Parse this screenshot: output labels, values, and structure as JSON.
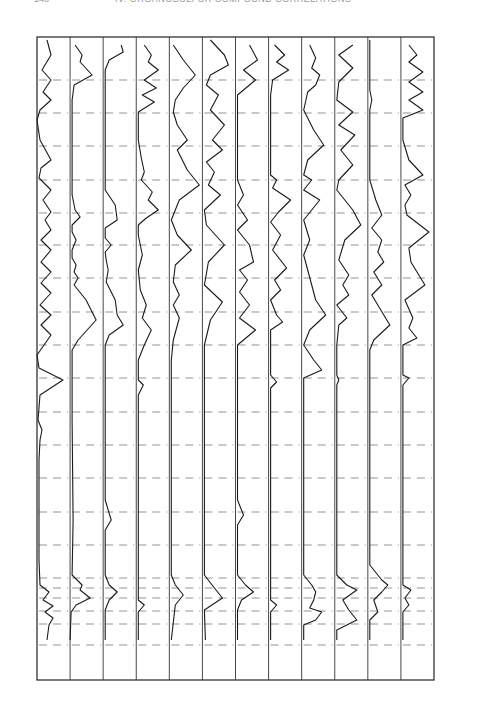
{
  "header": {
    "page_number": "148",
    "title": "IV. ORGANOSULFUR COMPOUND CORRELATIONS"
  },
  "chart_data": {
    "type": "line",
    "orientation": "rotated 90° (wavenumber runs bottom-to-top)",
    "xlabel": "CM-1",
    "x_secondary_label": "µm",
    "x_ticks_wavenumber": [
      "600",
      "700",
      "800",
      "900",
      "1000",
      "1100",
      "1200",
      "1300",
      "1400",
      "1500",
      "1600",
      "1700",
      "1800",
      "1900",
      "2000",
      "2400",
      "2800",
      "3200",
      "3600",
      "4000"
    ],
    "x_ticks_wavelength": [
      "14",
      "12",
      "10",
      "9",
      "8",
      "7",
      "6",
      "5",
      "4",
      "3",
      "2.5 µm"
    ],
    "series": [
      {
        "id": "541",
        "formula": "CH3-CH2-CH2-S-CH=CH2",
        "condition": ".015",
        "labels": [
          "=CH2",
          "2x880",
          "C=C STR",
          "=CH2 WAG",
          "C=C-H"
        ]
      },
      {
        "id": "542",
        "formula": "CH3-S(=O)-CH3",
        "condition": ".015, CAP",
        "labels": [
          "SCH3 STR",
          "SCH3 ASYM DEF",
          "SCH3 SYM DEF",
          "SCH3 RK",
          "SO STR",
          "C-S STR"
        ]
      },
      {
        "id": "543",
        "formula": "N≡C-CH2-CH2-S(=O)-CH2-CH2-C≡N",
        "condition": "N",
        "labels": [
          "N",
          "C≡N",
          "N",
          "CH2 DEF",
          "SO STR"
        ]
      },
      {
        "id": "544",
        "formula": "Ph-S(=O)-Ph",
        "condition": "N",
        "labels": [
          "φ",
          "φ",
          "φ",
          "φ-S",
          "SO",
          "φ",
          "φ",
          "φ"
        ]
      },
      {
        "id": "545",
        "formula": "C2H5-O-S(=O)-O-C2H5",
        "condition": ".015",
        "labels": [
          "OCH2 DEF",
          "CH3",
          "OCH2 WAG",
          "S=O",
          "SOC",
          "OSO"
        ]
      },
      {
        "id": "546",
        "formula": "n-C4H9-O-S(=O)-O-n-C4H9",
        "condition": ".02, CAP",
        "labels": [
          "CH2",
          "CH3",
          "S=O",
          "SOC",
          "OSO"
        ]
      },
      {
        "id": "547",
        "formula": "N≡C-CH2-CH2-S(=O)(=O)-CH2-CH2-C≡N",
        "condition": "N",
        "labels": [
          "C≡N",
          "N",
          "N",
          "CH2",
          "SO2 ASYM",
          "SO2 SYM"
        ]
      },
      {
        "id": "548",
        "formula": "Ph-S(=O)(=O)-Ph",
        "condition": "N, HCBD",
        "labels": [
          "φ",
          "φ",
          "φ",
          "SO2 ASYM",
          "SO2 SYM",
          "φ-S",
          "φ",
          "φ"
        ]
      },
      {
        "id": "549",
        "formula": "Ph-S(=O)(=O)-NH2",
        "condition": "N",
        "labels": [
          "NH2 STR",
          "N",
          "NH2 DEF",
          "N",
          "SO2",
          "SO2",
          "φ-S",
          "S-N",
          "φ",
          "NH2 WAG"
        ]
      },
      {
        "id": "550",
        "formula": "CH2=CH-S(=O)(=O)-NH-CH(CH3)-CH3",
        "condition": ".015",
        "labels": [
          "NH",
          "CH3",
          "2x970",
          "C=C",
          "SO2",
          "SO2",
          "H-C=C-H =CH2"
        ]
      },
      {
        "id": "551",
        "formula": "Br-CH2-CH2-S(=O)(=O)-NH-CH(CH3)-CH3",
        "condition": "N",
        "labels": [
          "NH",
          "N",
          "N",
          "SO2",
          "SO2",
          "SO2"
        ]
      },
      {
        "id": "552",
        "formula": "Ph-S(=O)(=O)-O-CH3",
        "condition": ".015",
        "labels": [
          "CH3",
          "φ",
          "φ",
          "CH3",
          "SO2",
          "SO2",
          "S-φ",
          "S-O-C",
          "SOC",
          "φ"
        ]
      }
    ]
  },
  "strips": [
    {
      "id": "541",
      "cond": ".015",
      "f": "CH₃-CH₂-CH₂-S-CH=CH₂",
      "f2": ""
    },
    {
      "id": "542",
      "cond": ".015, CAP",
      "f": "CH₃-S-CH₃",
      "f2": "O"
    },
    {
      "id": "543",
      "cond": "N",
      "f": "N≡C-CH₂-CH₂-S-CH₂-CH₂-C≡N",
      "f2": "O"
    },
    {
      "id": "544",
      "cond": "N",
      "f": "⌬-S-⌬",
      "f2": "O"
    },
    {
      "id": "545",
      "cond": ".015",
      "f": "C₂H₅-O-S-O-C₂H₅",
      "f2": "O"
    },
    {
      "id": "546",
      "cond": ".02 , CAP",
      "f": "n-C₄H₉-O-S-O-n-C₄H₉",
      "f2": "O"
    },
    {
      "id": "547",
      "cond": "N",
      "f": "N≡C-CH₂-CH₂-S-CH₂-CH₂-C≡N",
      "f2": "O   O"
    },
    {
      "id": "548",
      "cond": "N, HCBD",
      "f": "O=S=O  ⌬ ⌬",
      "f2": ""
    },
    {
      "id": "549",
      "cond": "N",
      "f": "⌬-O=S=O-NH₂",
      "f2": ""
    },
    {
      "id": "550",
      "cond": ".015",
      "f": "CH₂=CH-S-NH-CH(CH₃)CH₃",
      "f2": "O   O"
    },
    {
      "id": "551",
      "cond": "N",
      "f": "Br-CH₂-CH₂-S-NH-CH(CH₃)CH₃",
      "f2": "O   O"
    },
    {
      "id": "552",
      "cond": ".015",
      "f": "⌬-S-O-CH₃",
      "f2": "O   O"
    }
  ],
  "axis": {
    "right_unit": "CM⁻¹",
    "right_ticks": [
      {
        "t": "600",
        "y": 47
      },
      {
        "t": "700",
        "y": 80
      },
      {
        "t": "800",
        "y": 113
      },
      {
        "t": "900",
        "y": 146
      },
      {
        "t": "1000",
        "y": 180
      },
      {
        "t": "1100",
        "y": 213
      },
      {
        "t": "1200",
        "y": 245
      },
      {
        "t": "1300",
        "y": 278
      },
      {
        "t": "1400",
        "y": 312
      },
      {
        "t": "1500",
        "y": 345
      },
      {
        "t": "1600",
        "y": 378
      },
      {
        "t": "1700",
        "y": 412
      },
      {
        "t": "1800",
        "y": 445
      },
      {
        "t": "1900",
        "y": 478
      },
      {
        "t": "2000",
        "y": 512
      },
      {
        "t": "2400",
        "y": 545
      },
      {
        "t": "2800",
        "y": 578
      },
      {
        "t": "3200",
        "y": 611
      },
      {
        "t": "3600",
        "y": 645
      },
      {
        "t": "4000",
        "y": 676
      }
    ],
    "left_ticks": [
      {
        "t": "14",
        "y": 73
      },
      {
        "t": "12",
        "y": 113
      },
      {
        "t": "10",
        "y": 168
      },
      {
        "t": "9",
        "y": 212
      },
      {
        "t": "8",
        "y": 258
      },
      {
        "t": "7",
        "y": 318
      },
      {
        "t": "6",
        "y": 407
      },
      {
        "t": "5",
        "y": 512
      },
      {
        "t": "4",
        "y": 545
      },
      {
        "t": "3",
        "y": 618
      },
      {
        "t": "2.5 µm",
        "y": 668
      }
    ]
  },
  "annotations": [
    {
      "s": 0,
      "y": 168,
      "t": "=CH₂ WAG"
    },
    {
      "s": 0,
      "y": 208,
      "t": "C=C-H"
    },
    {
      "s": 0,
      "y": 378,
      "t": "C=C STR"
    },
    {
      "s": 0,
      "y": 425,
      "t": "2×880"
    },
    {
      "s": 0,
      "y": 612,
      "t": "=CH₂"
    },
    {
      "s": 1,
      "y": 75,
      "t": "C-S STR"
    },
    {
      "s": 1,
      "y": 218,
      "t": "SO STR"
    },
    {
      "s": 1,
      "y": 240,
      "t": "SCH₃ RK"
    },
    {
      "s": 1,
      "y": 265,
      "t": "SCH₃ SYM DEF"
    },
    {
      "s": 1,
      "y": 340,
      "t": "SCH₃ ASYM DEF"
    },
    {
      "s": 1,
      "y": 580,
      "t": "SCH₃ STR"
    },
    {
      "s": 2,
      "y": 218,
      "t": "SO STR"
    },
    {
      "s": 2,
      "y": 300,
      "t": "N"
    },
    {
      "s": 2,
      "y": 320,
      "t": "CH₂ DEF"
    },
    {
      "s": 2,
      "y": 330,
      "t": "N"
    },
    {
      "s": 2,
      "y": 525,
      "t": "C≡N"
    },
    {
      "s": 2,
      "y": 590,
      "t": "N"
    },
    {
      "s": 3,
      "y": 62,
      "t": "φ"
    },
    {
      "s": 3,
      "y": 100,
      "t": "φ"
    },
    {
      "s": 3,
      "y": 178,
      "t": "φ"
    },
    {
      "s": 3,
      "y": 205,
      "t": "SO"
    },
    {
      "s": 3,
      "y": 220,
      "t": "φ-S"
    },
    {
      "s": 3,
      "y": 318,
      "t": "φ"
    },
    {
      "s": 3,
      "y": 345,
      "t": "φ"
    },
    {
      "s": 3,
      "y": 370,
      "t": "φ"
    },
    {
      "s": 3,
      "y": 603,
      "t": "φ"
    },
    {
      "s": 4,
      "y": 80,
      "t": "OSO"
    },
    {
      "s": 4,
      "y": 187,
      "t": "SOC"
    },
    {
      "s": 4,
      "y": 245,
      "t": "S=O"
    },
    {
      "s": 4,
      "y": 300,
      "t": "OCH₂ WAG"
    },
    {
      "s": 4,
      "y": 335,
      "t": "CH₃"
    },
    {
      "s": 4,
      "y": 345,
      "t": "OCH₂ DEF"
    },
    {
      "s": 5,
      "y": 80,
      "t": "OSO"
    },
    {
      "s": 5,
      "y": 150,
      "t": "SOC"
    },
    {
      "s": 5,
      "y": 245,
      "t": "S=O"
    },
    {
      "s": 5,
      "y": 295,
      "t": "CH₃"
    },
    {
      "s": 5,
      "y": 345,
      "t": "CH₂"
    },
    {
      "s": 6,
      "y": 325,
      "t": "N"
    },
    {
      "s": 6,
      "y": 300,
      "t": "N"
    },
    {
      "s": 6,
      "y": 310,
      "t": "CH₂"
    },
    {
      "s": 6,
      "y": 270,
      "t": "SO₂ ASYM"
    },
    {
      "s": 6,
      "y": 215,
      "t": "SO₂ SYM"
    },
    {
      "s": 6,
      "y": 520,
      "t": "C≡N"
    },
    {
      "s": 6,
      "y": 590,
      "t": "N"
    },
    {
      "s": 7,
      "y": 80,
      "t": "φ"
    },
    {
      "s": 7,
      "y": 178,
      "t": "φ"
    },
    {
      "s": 7,
      "y": 195,
      "t": "φ-S"
    },
    {
      "s": 7,
      "y": 225,
      "t": "SO₂ SYM"
    },
    {
      "s": 7,
      "y": 285,
      "t": "SO₂ ASYM"
    },
    {
      "s": 7,
      "y": 325,
      "t": "φ"
    },
    {
      "s": 7,
      "y": 370,
      "t": "φ"
    },
    {
      "s": 7,
      "y": 600,
      "t": "φ"
    },
    {
      "s": 8,
      "y": 80,
      "t": "NH₂ WAG"
    },
    {
      "s": 8,
      "y": 70,
      "t": "φ"
    },
    {
      "s": 8,
      "y": 100,
      "t": "φ"
    },
    {
      "s": 8,
      "y": 145,
      "t": "S-N"
    },
    {
      "s": 8,
      "y": 180,
      "t": "φ"
    },
    {
      "s": 8,
      "y": 200,
      "t": "φ-S"
    },
    {
      "s": 8,
      "y": 225,
      "t": "SO₂"
    },
    {
      "s": 8,
      "y": 285,
      "t": "SO₂"
    },
    {
      "s": 8,
      "y": 330,
      "t": "N"
    },
    {
      "s": 8,
      "y": 360,
      "t": "NH₂ DEF"
    },
    {
      "s": 8,
      "y": 590,
      "t": "N"
    },
    {
      "s": 8,
      "y": 615,
      "t": "NH₂ STR"
    },
    {
      "s": 9,
      "y": 160,
      "t": "H-C=C-H =CH₂"
    },
    {
      "s": 9,
      "y": 225,
      "t": "SO₂"
    },
    {
      "s": 9,
      "y": 285,
      "t": "SO₂"
    },
    {
      "s": 9,
      "y": 380,
      "t": "C=C"
    },
    {
      "s": 9,
      "y": 510,
      "t": "2×970"
    },
    {
      "s": 9,
      "y": 590,
      "t": "CH₃"
    },
    {
      "s": 9,
      "y": 620,
      "t": "NH"
    },
    {
      "s": 10,
      "y": 220,
      "t": "SO₂"
    },
    {
      "s": 10,
      "y": 282,
      "t": "SO₂"
    },
    {
      "s": 10,
      "y": 302,
      "t": "N"
    },
    {
      "s": 10,
      "y": 330,
      "t": "N"
    },
    {
      "s": 10,
      "y": 590,
      "t": "N"
    },
    {
      "s": 10,
      "y": 620,
      "t": "NH"
    },
    {
      "s": 11,
      "y": 100,
      "t": "φ"
    },
    {
      "s": 11,
      "y": 108,
      "t": "SOC"
    },
    {
      "s": 11,
      "y": 170,
      "t": "S-O-C"
    },
    {
      "s": 11,
      "y": 190,
      "t": "φ"
    },
    {
      "s": 11,
      "y": 203,
      "t": "φ"
    },
    {
      "s": 11,
      "y": 212,
      "t": "S-φ"
    },
    {
      "s": 11,
      "y": 232,
      "t": "SO₂"
    },
    {
      "s": 11,
      "y": 290,
      "t": "SO₂"
    },
    {
      "s": 11,
      "y": 330,
      "t": "CH₃"
    },
    {
      "s": 11,
      "y": 340,
      "t": "φ"
    },
    {
      "s": 11,
      "y": 380,
      "t": "φ"
    },
    {
      "s": 11,
      "y": 590,
      "t": "CH₃"
    },
    {
      "s": 11,
      "y": 600,
      "t": "φ"
    }
  ],
  "spectra": [
    "10,40 14,55 5,70 14,80 6,92 14,100 3,110 0,120 3,140 14,160 4,168 2,178 14,190 6,200 14,212 8,220 14,230 4,240 14,250 4,262 14,272 4,283 14,293 3,305 14,315 4,325 14,335 0,355 2,368 26,380 3,395 1,420 5,430 3,440 2,460 2,560 3,585 12,592 6,600 16,606 8,612 16,618 12,625 10,640",
    "5,45 12,55 10,62 22,75 4,85 2,100 2,180 2,195 5,210 10,217 2,225 2,232 6,240 2,250 2,258 6,265 4,272 8,278 4,285 16,300 26,320 8,340 2,350 2,420 3,520 2,575 12,585 10,590 20,598 6,605 1,612 0,640",
    "18,45 20,52 6,60 2,70 2,190 12,205 14,220 2,228 2,238 8,245 2,252 3,260 5,270 3,282 12,300 14,315 20,325 6,335 2,345 2,500 8,520 2,530 2,575 6,585 14,592 6,600 2,610 2,640",
    "8,45 15,55 12,62 22,70 8,80 20,88 6,95 18,102 2,112 2,140 5,158 8,172 5,180 16,192 12,200 22,210 10,218 2,225 2,235 6,255 2,270 4,290 10,305 6,318 15,330 8,345 2,360 2,380 7,385 2,395 2,600 8,605 2,612 2,640",
    "4,45 14,60 26,75 14,88 6,100 4,112 8,125 18,140 8,150 18,170 30,185 10,200 2,220 8,235 22,250 6,265 4,282 10,295 4,305 10,318 4,340 2,360 2,575 6,585 14,595 6,605 2,640",
    "8,40 22,55 26,65 8,75 4,85 16,95 8,110 22,125 10,140 20,150 4,162 12,172 6,185 18,195 2,210 4,225 22,245 6,262 2,285 20,302 8,320 2,345 2,380 2,575 12,588 20,598 2,610 3,640",
    "14,45 22,60 8,70 20,80 2,95 2,180 8,195 2,205 12,220 2,230 14,245 18,262 4,270 12,280 4,292 14,305 4,318 20,330 2,345 2,500 8,515 2,525 2,575 10,585 18,592 6,600 2,610 2,640",
    "6,45 16,55 8,62 20,70 4,80 2,95 2,175 8,180 4,188 22,200 10,212 2,222 12,235 4,250 18,268 6,280 12,290 2,300 8,315 14,322 2,330 2,375 8,382 2,388 2,600 8,605 2,612 2,640",
    "8,45 14,58 10,68 18,75 14,85 6,92 2,110 12,130 22,145 6,160 2,175 10,180 2,190 18,200 10,210 2,220 8,240 2,255 6,270 10,285 14,300 24,315 8,330 2,345 12,360 20,370 2,378 2,575 10,585 14,592 12,600 8,608 20,612 14,620 2,625 2,640",
    "18,45 4,55 18,68 4,82 2,100 18,112 4,125 20,135 6,150 18,165 4,180 2,190 18,210 26,225 10,240 4,260 14,275 8,285 14,295 2,305 12,318 4,325 2,345 2,375 4,380 2,385 2,575 12,585 22,590 8,600 14,610 22,620 2,630 2,640",
    "2,40 2,90 4,100 2,110 2,180 8,200 14,215 4,228 14,240 10,252 16,262 6,272 14,285 4,295 10,305 22,325 6,340 2,350 2,565 14,580 20,585 14,592 6,600 10,612 2,620 2,640",
    "8,45 16,55 8,62 22,72 8,82 22,92 8,100 22,110 2,118 2,140 8,160 22,175 4,185 10,195 4,205 6,215 28,232 8,248 10,262 24,285 4,300 12,318 8,328 16,338 2,345 2,375 8,378 2,385 2,585 10,590 4,598 8,605 2,612 2,640"
  ],
  "grid_y": [
    80,
    113,
    146,
    180,
    213,
    245,
    278,
    312,
    345,
    378,
    412,
    445,
    478,
    512,
    545,
    578,
    588,
    598,
    611,
    624,
    645
  ]
}
